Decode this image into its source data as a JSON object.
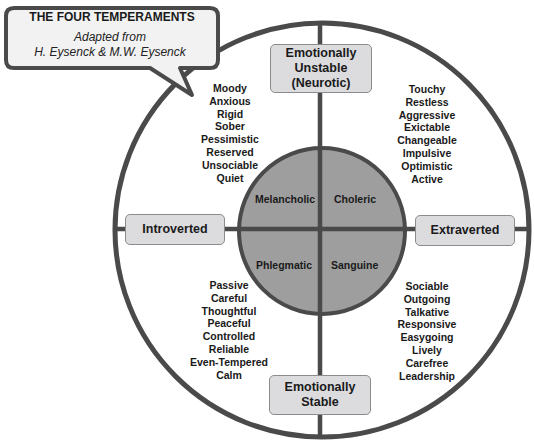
{
  "callout": {
    "title": "THE FOUR TEMPERAMENTS",
    "subtitle_line1": "Adapted from",
    "subtitle_line2": "H. Eysenck & M.W. Eysenck"
  },
  "axes": {
    "top": {
      "line1": "Emotionally",
      "line2": "Unstable",
      "line3": "(Neurotic)"
    },
    "bottom": {
      "line1": "Emotionally",
      "line2": "Stable"
    },
    "left": {
      "label": "Introverted"
    },
    "right": {
      "label": "Extraverted"
    }
  },
  "temperaments": {
    "top_left": "Melancholic",
    "top_right": "Choleric",
    "bottom_left": "Phlegmatic",
    "bottom_right": "Sanguine"
  },
  "traits": {
    "melancholic": [
      "Moody",
      "Anxious",
      "Rigid",
      "Sober",
      "Pessimistic",
      "Reserved",
      "Unsociable",
      "Quiet"
    ],
    "choleric": [
      "Touchy",
      "Restless",
      "Aggressive",
      "Exictable",
      "Changeable",
      "Impulsive",
      "Optimistic",
      "Active"
    ],
    "phlegmatic": [
      "Passive",
      "Careful",
      "Thoughtful",
      "Peaceful",
      "Controlled",
      "Reliable",
      "Even-Tempered",
      "Calm"
    ],
    "sanguine": [
      "Sociable",
      "Outgoing",
      "Talkative",
      "Responsive",
      "Easygoing",
      "Lively",
      "Carefree",
      "Leadership"
    ]
  },
  "colors": {
    "stroke": "#4a4a4a",
    "inner_fill": "#9e9e9e",
    "box_fill": "#dcdcdf",
    "background": "#ffffff"
  }
}
